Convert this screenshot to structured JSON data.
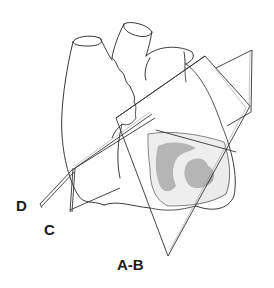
{
  "figure": {
    "labels": {
      "d": "D",
      "c": "C",
      "ab": "A-B"
    },
    "colors": {
      "outline": "#222222",
      "plane_edge": "#333333",
      "plane_fill": "#ffffff",
      "section_light": "#ececec",
      "section_dark": "#a8a8a8"
    }
  }
}
